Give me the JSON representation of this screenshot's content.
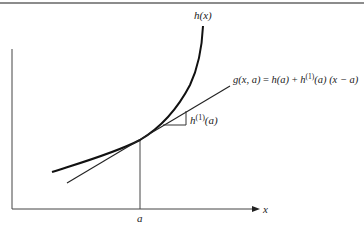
{
  "figure": {
    "type": "tangent-line-approximation",
    "curve_label": "h(x)",
    "tangent_equation": {
      "lhs": "g(x, a)",
      "equals": "=",
      "term1": "h(a)",
      "plus": "+",
      "term2_base": "h",
      "term2_sup": "(1)",
      "term2_arg": "(a)",
      "term3": "(x − a)"
    },
    "slope_label": {
      "base": "h",
      "sup": "(1)",
      "arg": "(a)"
    },
    "x_axis_label": "x",
    "point_label": "a",
    "colors": {
      "line": "#222222",
      "rule": "#555555",
      "background": "#ffffff"
    }
  }
}
